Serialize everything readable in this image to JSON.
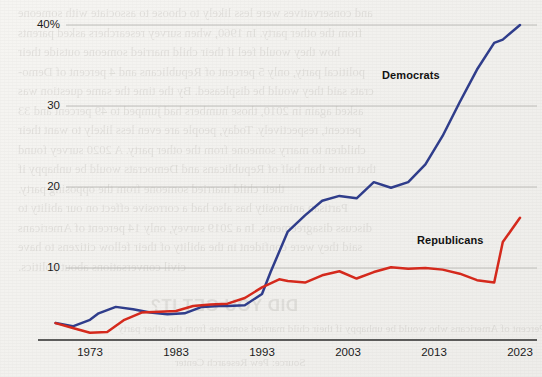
{
  "chart_data": {
    "type": "line",
    "title": "",
    "subtitle": "",
    "xlabel": "",
    "ylabel": "",
    "xlim": [
      1969,
      2023
    ],
    "ylim": [
      0,
      42
    ],
    "grid": "horizontal",
    "legend_position": "inline-annotation",
    "y_ticks": [
      {
        "value": 40,
        "label": "40%"
      },
      {
        "value": 30,
        "label": "30"
      },
      {
        "value": 20,
        "label": "20"
      },
      {
        "value": 10,
        "label": "10"
      }
    ],
    "x_ticks": [
      {
        "value": 1973,
        "label": "1973"
      },
      {
        "value": 1983,
        "label": "1983"
      },
      {
        "value": 1993,
        "label": "1993"
      },
      {
        "value": 2003,
        "label": "2003"
      },
      {
        "value": 2013,
        "label": "2013"
      },
      {
        "value": 2023,
        "label": "2023"
      }
    ],
    "series": [
      {
        "name": "Democrats",
        "color": "#2f3d8c",
        "label_text": "Democrats",
        "x": [
          1969,
          1971,
          1973,
          1974,
          1976,
          1978,
          1980,
          1982,
          1984,
          1986,
          1988,
          1989,
          1991,
          1993,
          1994,
          1996,
          1998,
          2000,
          2002,
          2004,
          2006,
          2008,
          2010,
          2012,
          2014,
          2016,
          2018,
          2020,
          2021,
          2023
        ],
        "values": [
          3.2,
          2.8,
          3.6,
          4.4,
          5.2,
          4.9,
          4.5,
          4.3,
          4.4,
          5.2,
          5.3,
          5.3,
          5.4,
          6.8,
          9.5,
          14.5,
          16.5,
          18.3,
          18.9,
          18.6,
          20.6,
          19.9,
          20.6,
          22.8,
          26.3,
          30.5,
          34.5,
          37.8,
          38.2,
          40.0
        ]
      },
      {
        "name": "Republicans",
        "color": "#d6291c",
        "label_text": "Republicans",
        "x": [
          1969,
          1971,
          1973,
          1975,
          1977,
          1979,
          1981,
          1983,
          1985,
          1987,
          1989,
          1991,
          1993,
          1995,
          1996,
          1998,
          2000,
          2002,
          2004,
          2006,
          2008,
          2010,
          2012,
          2014,
          2016,
          2018,
          2020,
          2021,
          2023
        ],
        "values": [
          3.2,
          2.6,
          2.0,
          2.1,
          3.6,
          4.5,
          4.6,
          4.7,
          5.3,
          5.5,
          5.6,
          6.3,
          7.6,
          8.6,
          8.4,
          8.2,
          9.1,
          9.6,
          8.7,
          9.5,
          10.1,
          9.9,
          10.0,
          9.8,
          9.3,
          8.5,
          8.2,
          13.2,
          16.2
        ]
      }
    ]
  },
  "bleed_text": {
    "lines": [
      "and conservatives were less likely to choose to associate with someone",
      "from the other party. In 1960, when survey researchers asked parents",
      "how they would feel if their child married someone outside their",
      "political party, only 5 percent of Republicans and 4 percent of Demo-",
      "crats said they would be displeased. By the time the same question was",
      "asked again in 2010, those numbers had jumped to 49 percent and 33",
      "percent, respectively. Today, people are even less likely to want their",
      "children to marry someone from the other party. A 2020 survey found",
      "that more than half of Republicans and Democrats would be unhappy if",
      "their child married someone from the opposing party.",
      "Partisan animosity has also had a corrosive effect on our ability to",
      "discuss disagreements. In a 2019 survey, only 14 percent of Americans",
      "said they were confident in the ability of their fellow citizens to have",
      "civil conversations about politics."
    ],
    "headline": "DID YOU GET IT?",
    "caption": "Percent of Americans who would be unhappy if their child married someone from the other party",
    "subcaption": "Source: Pew Research Center"
  }
}
